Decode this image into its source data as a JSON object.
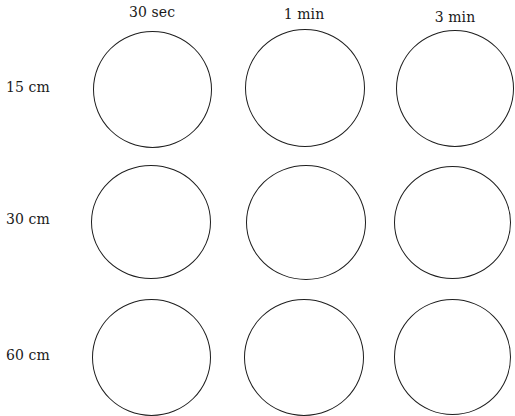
{
  "diagram": {
    "columns": [
      {
        "label": "30 sec"
      },
      {
        "label": "1 min"
      },
      {
        "label": "3 min"
      }
    ],
    "rows": [
      {
        "label": "15 cm"
      },
      {
        "label": "30 cm"
      },
      {
        "label": "60 cm"
      }
    ],
    "cells": [
      [
        {
          "row": "15 cm",
          "col": "30 sec"
        },
        {
          "row": "15 cm",
          "col": "1 min"
        },
        {
          "row": "15 cm",
          "col": "3 min"
        }
      ],
      [
        {
          "row": "30 cm",
          "col": "30 sec"
        },
        {
          "row": "30 cm",
          "col": "1 min"
        },
        {
          "row": "30 cm",
          "col": "3 min"
        }
      ],
      [
        {
          "row": "60 cm",
          "col": "30 sec"
        },
        {
          "row": "60 cm",
          "col": "1 min"
        },
        {
          "row": "60 cm",
          "col": "3 min"
        }
      ]
    ],
    "stroke_color": "#1e1e1e",
    "background_color": "#ffffff"
  }
}
